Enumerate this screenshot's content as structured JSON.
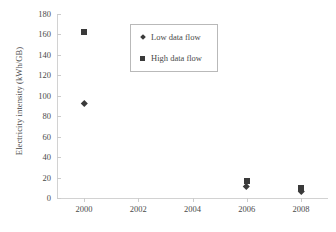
{
  "chart_data": {
    "type": "scatter",
    "title": "",
    "xlabel": "",
    "ylabel": "Electricity intensity (kWh/GB)",
    "xlim": [
      1999,
      2009
    ],
    "ylim": [
      0,
      180
    ],
    "grid": false,
    "legend_position": "top-center",
    "x_tick_labels": [
      "2000",
      "2002",
      "2004",
      "2006",
      "2008"
    ],
    "x_ticks": [
      2000,
      2002,
      2004,
      2006,
      2008
    ],
    "y_tick_labels": [
      "0",
      "20",
      "40",
      "60",
      "80",
      "100",
      "120",
      "140",
      "160",
      "180"
    ],
    "y_ticks": [
      0,
      20,
      40,
      60,
      80,
      100,
      120,
      140,
      160,
      180
    ],
    "series": [
      {
        "name": "Low data flow",
        "marker": "diamond",
        "color": "#3a3a3a",
        "points": [
          {
            "x": 2000,
            "y": 93
          },
          {
            "x": 2006,
            "y": 11
          },
          {
            "x": 2008,
            "y": 7
          }
        ]
      },
      {
        "name": "High data flow",
        "marker": "square",
        "color": "#3a3a3a",
        "points": [
          {
            "x": 2000,
            "y": 162
          },
          {
            "x": 2006,
            "y": 17
          },
          {
            "x": 2008,
            "y": 10
          }
        ]
      }
    ]
  },
  "legend": {
    "entries": [
      {
        "label": "Low data flow",
        "marker": "diamond"
      },
      {
        "label": "High data flow",
        "marker": "square"
      }
    ]
  }
}
